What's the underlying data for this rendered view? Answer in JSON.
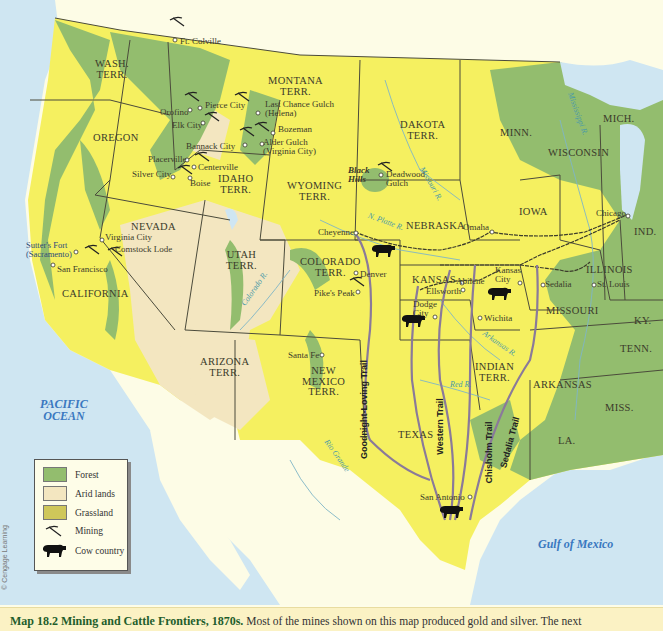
{
  "map": {
    "title": "Mining and Cattle Frontiers, 1870s",
    "number": "Map 18.2",
    "colors": {
      "forest": "#93bd6e",
      "arid": "#f3e6c0",
      "grassland": "#f5f060",
      "water": "#cfe6f2",
      "foreign_land": "#fdfce6",
      "trail": "#8a7a9a",
      "border": "#4b4b3b",
      "caption_bg": "#fbf2c4",
      "caption_title": "#1f5e2c"
    },
    "water_labels": [
      {
        "name": "PACIFIC OCEAN",
        "line1": "PACIFIC",
        "line2": "OCEAN"
      },
      {
        "name": "Gulf of Mexico"
      }
    ],
    "states": [
      {
        "line1": "WASH.",
        "line2": "TERR."
      },
      {
        "line1": "MONTANA",
        "line2": "TERR."
      },
      {
        "line1": "OREGON",
        "line2": ""
      },
      {
        "line1": "IDAHO",
        "line2": "TERR."
      },
      {
        "line1": "DAKOTA",
        "line2": "TERR."
      },
      {
        "line1": "WYOMING",
        "line2": "TERR."
      },
      {
        "line1": "NEVADA",
        "line2": ""
      },
      {
        "line1": "UTAH",
        "line2": "TERR."
      },
      {
        "line1": "CALIFORNIA",
        "line2": ""
      },
      {
        "line1": "COLORADO",
        "line2": "TERR."
      },
      {
        "line1": "ARIZONA",
        "line2": "TERR."
      },
      {
        "line1": "NEW",
        "line2": "MEXICO",
        "line3": "TERR."
      },
      {
        "line1": "NEBRASKA",
        "line2": ""
      },
      {
        "line1": "KANSAS",
        "line2": ""
      },
      {
        "line1": "INDIAN",
        "line2": "TERR."
      },
      {
        "line1": "TEXAS",
        "line2": ""
      },
      {
        "line1": "MINN.",
        "line2": ""
      },
      {
        "line1": "IOWA",
        "line2": ""
      },
      {
        "line1": "WISCONSIN",
        "line2": ""
      },
      {
        "line1": "MICH.",
        "line2": ""
      },
      {
        "line1": "IND.",
        "line2": ""
      },
      {
        "line1": "ILLINOIS",
        "line2": ""
      },
      {
        "line1": "MISSOURI",
        "line2": ""
      },
      {
        "line1": "KY.",
        "line2": ""
      },
      {
        "line1": "TENN.",
        "line2": ""
      },
      {
        "line1": "ARKANSAS",
        "line2": ""
      },
      {
        "line1": "MISS.",
        "line2": ""
      },
      {
        "line1": "LA.",
        "line2": ""
      }
    ],
    "places": [
      "Ft. Colville",
      "Pierce City",
      "Orofino",
      "Elk City",
      "Last Chance Gulch",
      "(Helena)",
      "Bozeman",
      "Alder Gulch",
      "(Virginia City)",
      "Bannack City",
      "Placerville",
      "Centerville",
      "Silver City",
      "Boise",
      "Deadwood",
      "Gulch",
      "Virginia City",
      "Comstock Lode",
      "Sutter's Fort",
      "(Sacramento)",
      "San Francisco",
      "Cheyenne",
      "Denver",
      "Pike's Peak",
      "Santa Fe",
      "Omaha",
      "Chicago",
      "Kansas",
      "City",
      "Abilene",
      "Ellsworth",
      "Dodge",
      "City",
      "Wichita",
      "Sedalia",
      "St. Louis",
      "San Antonio"
    ],
    "regions": [
      {
        "line1": "Black",
        "line2": "Hills"
      }
    ],
    "rivers": [
      "Missouri R.",
      "N. Platte R.",
      "Mississippi R.",
      "Colorado R.",
      "Arkansas R.",
      "Red R.",
      "Rio Grande"
    ],
    "trails": [
      "Goodnight-Loving Trail",
      "Western Trail",
      "Chisholm Trail",
      "Sedalia Trail"
    ]
  },
  "legend": {
    "items": [
      {
        "label": "Forest",
        "icon": "forest-swatch",
        "color": "#93bd6e"
      },
      {
        "label": "Arid lands",
        "icon": "arid-swatch",
        "color": "#f3e6c0"
      },
      {
        "label": "Grassland",
        "icon": "grassland-swatch",
        "color": "#cfc75a"
      },
      {
        "label": "Mining",
        "icon": "pickaxe-icon"
      },
      {
        "label": "Cow country",
        "icon": "cow-icon"
      }
    ]
  },
  "credit": "© Cengage Learning",
  "caption": {
    "number": "Map 18.2",
    "title": "Mining and Cattle Frontiers, 1870s.",
    "text": "Most of the mines shown on this map produced gold and silver. The next"
  }
}
